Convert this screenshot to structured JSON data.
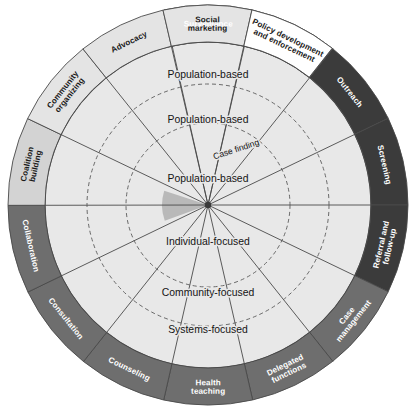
{
  "diagram": {
    "center": {
      "x": 208,
      "y": 205
    },
    "radii": {
      "outer_ring_outer": 200,
      "outer_ring_inner": 163,
      "r_systems": 163,
      "r_community": 121,
      "r_individual": 82,
      "r_core": 46
    },
    "colors": {
      "black": "#141414",
      "dark_gray": "#3b3b3b",
      "mid_gray": "#6e6e6e",
      "light_gray": "#d3d3d3",
      "pale_gray": "#e4e4e4",
      "wedge_fill": "#e8e8e8",
      "core_fill": "#dcdcdc",
      "highlight_wedge": "#b9b9b9",
      "stroke": "#4a4a4a",
      "dashed": "#8a8a8a",
      "white": "#ffffff"
    },
    "outer_segments": [
      {
        "label": "Surveillance",
        "shade": "black",
        "text": "light",
        "start_deg": -102.7,
        "end_deg": -77.1
      },
      {
        "label": "Disease and health event investigation",
        "shade": "black",
        "text": "light",
        "start_deg": -77.1,
        "end_deg": -51.4
      },
      {
        "label": "Outreach",
        "shade": "dark_gray",
        "text": "light",
        "start_deg": -51.4,
        "end_deg": -25.7
      },
      {
        "label": "Screening",
        "shade": "dark_gray",
        "text": "light",
        "start_deg": -25.7,
        "end_deg": 0
      },
      {
        "label": "Referral and follow-up",
        "shade": "dark_gray",
        "text": "light",
        "start_deg": 0,
        "end_deg": 25.7
      },
      {
        "label": "Case management",
        "shade": "mid_gray",
        "text": "light",
        "start_deg": 25.7,
        "end_deg": 51.4
      },
      {
        "label": "Delegated functions",
        "shade": "mid_gray",
        "text": "light",
        "start_deg": 51.4,
        "end_deg": 77.1
      },
      {
        "label": "Health teaching",
        "shade": "mid_gray",
        "text": "light",
        "start_deg": 77.1,
        "end_deg": 102.8
      },
      {
        "label": "Counseling",
        "shade": "mid_gray",
        "text": "light",
        "start_deg": 102.8,
        "end_deg": 128.5
      },
      {
        "label": "Consultation",
        "shade": "mid_gray",
        "text": "light",
        "start_deg": 128.5,
        "end_deg": 154.2
      },
      {
        "label": "Collaboration",
        "shade": "mid_gray",
        "text": "light",
        "start_deg": 154.2,
        "end_deg": 179.9
      },
      {
        "label": "Coalition building",
        "shade": "light_gray",
        "text": "dark",
        "start_deg": 179.9,
        "end_deg": 205.6
      },
      {
        "label": "Community organizing",
        "shade": "pale_gray",
        "text": "dark",
        "start_deg": 205.6,
        "end_deg": 231.3
      },
      {
        "label": "Advocacy",
        "shade": "pale_gray",
        "text": "dark",
        "start_deg": 231.3,
        "end_deg": 257.0
      },
      {
        "label": "Social marketing",
        "shade": "pale_gray",
        "text": "dark",
        "start_deg": 257.0,
        "end_deg": 282.7
      },
      {
        "label": "Policy development and enforcement",
        "shade": "white",
        "text": "dark",
        "start_deg": 282.7,
        "end_deg": 308.4
      }
    ],
    "ring_labels": [
      {
        "label": "Population-based",
        "ring": "systems",
        "x": 208,
        "y": 78,
        "size": "normal"
      },
      {
        "label": "Population-based",
        "ring": "community",
        "x": 208,
        "y": 123,
        "size": "normal"
      },
      {
        "label": "Case finding",
        "ring": "individual-upper",
        "x": 237,
        "y": 152,
        "size": "small",
        "rotate": -18
      },
      {
        "label": "Population-based",
        "ring": "individual",
        "x": 208,
        "y": 182,
        "size": "normal"
      },
      {
        "label": "Individual-focused",
        "ring": "individual",
        "x": 208,
        "y": 245,
        "size": "normal"
      },
      {
        "label": "Community-focused",
        "ring": "community",
        "x": 208,
        "y": 296,
        "size": "normal"
      },
      {
        "label": "Systems-focused",
        "ring": "systems",
        "x": 208,
        "y": 333,
        "size": "normal"
      }
    ]
  }
}
